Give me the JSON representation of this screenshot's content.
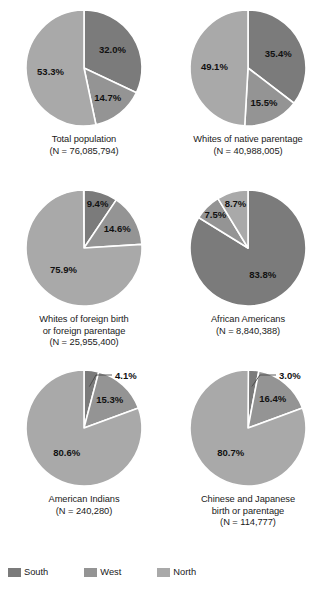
{
  "chart_data": {
    "type": "pie",
    "title": "",
    "legend_position": "bottom",
    "categories": [
      "South",
      "West",
      "North"
    ],
    "colors": {
      "South": "#7b7b7b",
      "West": "#949494",
      "North": "#a9a9a9",
      "divider": "#ffffff"
    },
    "panels": [
      {
        "id": "total-population",
        "caption_lines": [
          "Total population",
          "(N = 76,085,794)"
        ],
        "n_label": "(N = 76,085,794)",
        "name": "Total population",
        "n_value": 76085794,
        "slices": [
          {
            "category": "South",
            "value": 32.0,
            "label": "32.0%"
          },
          {
            "category": "West",
            "value": 14.7,
            "label": "14.7%"
          },
          {
            "category": "North",
            "value": 53.3,
            "label": "53.3%"
          }
        ]
      },
      {
        "id": "whites-native-parentage",
        "caption_lines": [
          "Whites of native parentage",
          "(N = 40,988,005)"
        ],
        "n_label": "(N = 40,988,005)",
        "name": "Whites of native parentage",
        "n_value": 40988005,
        "slices": [
          {
            "category": "South",
            "value": 35.4,
            "label": "35.4%"
          },
          {
            "category": "West",
            "value": 15.5,
            "label": "15.5%"
          },
          {
            "category": "North",
            "value": 49.1,
            "label": "49.1%"
          }
        ]
      },
      {
        "id": "whites-foreign-birth",
        "caption_lines": [
          "Whites of foreign birth",
          "or foreign parentage",
          "(N = 25,955,400)"
        ],
        "n_label": "(N = 25,955,400)",
        "name": "Whites of foreign birth or foreign parentage",
        "n_value": 25955400,
        "slices": [
          {
            "category": "South",
            "value": 9.4,
            "label": "9.4%"
          },
          {
            "category": "West",
            "value": 14.6,
            "label": "14.6%"
          },
          {
            "category": "North",
            "value": 75.9,
            "label": "75.9%"
          }
        ]
      },
      {
        "id": "african-americans",
        "caption_lines": [
          "African Americans",
          "(N = 8,840,388)"
        ],
        "n_label": "(N = 8,840,388)",
        "name": "African Americans",
        "n_value": 8840388,
        "slices": [
          {
            "category": "South",
            "value": 83.8,
            "label": "83.8%"
          },
          {
            "category": "West",
            "value": 7.5,
            "label": "7.5%"
          },
          {
            "category": "North",
            "value": 8.7,
            "label": "8.7%"
          }
        ]
      },
      {
        "id": "american-indians",
        "caption_lines": [
          "American Indians",
          "(N = 240,280)"
        ],
        "n_label": "(N = 240,280)",
        "name": "American Indians",
        "n_value": 240280,
        "slices": [
          {
            "category": "South",
            "value": 4.1,
            "label": "4.1%"
          },
          {
            "category": "West",
            "value": 15.3,
            "label": "15.3%"
          },
          {
            "category": "North",
            "value": 80.6,
            "label": "80.6%"
          }
        ]
      },
      {
        "id": "chinese-japanese",
        "caption_lines": [
          "Chinese and Japanese",
          "birth or parentage",
          "(N = 114,777)"
        ],
        "n_label": "(N = 114,777)",
        "name": "Chinese and Japanese birth or parentage",
        "n_value": 114777,
        "slices": [
          {
            "category": "South",
            "value": 3.0,
            "label": "3.0%"
          },
          {
            "category": "West",
            "value": 16.4,
            "label": "16.4%"
          },
          {
            "category": "North",
            "value": 80.7,
            "label": "80.7%"
          }
        ]
      }
    ]
  },
  "legend": {
    "items": [
      {
        "label": "South",
        "color": "#7b7b7b"
      },
      {
        "label": "West",
        "color": "#949494"
      },
      {
        "label": "North",
        "color": "#a9a9a9"
      }
    ]
  }
}
